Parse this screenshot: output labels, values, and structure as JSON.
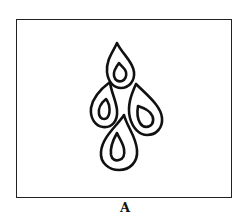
{
  "figure": {
    "label": "A",
    "stroke_color": "#111111",
    "background_color": "#ffffff"
  }
}
